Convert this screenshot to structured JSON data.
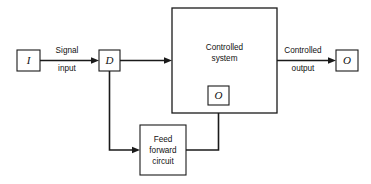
{
  "diagram": {
    "type": "block-diagram",
    "background_color": "#ffffff",
    "line_color": "#1a1a1a",
    "nodes": {
      "input": {
        "label": "I",
        "name": "input-block",
        "shape": "rect",
        "x": 17,
        "y": 50,
        "w": 23,
        "h": 21
      },
      "detector": {
        "label": "D",
        "name": "detector-block",
        "shape": "rect",
        "x": 99,
        "y": 50,
        "w": 21,
        "h": 21
      },
      "controlled_system": {
        "label_line1": "Controlled",
        "label_line2": "system",
        "name": "controlled-system-block",
        "shape": "rect",
        "x": 172,
        "y": 8,
        "w": 105,
        "h": 105
      },
      "inner_output": {
        "label": "O",
        "name": "inner-output-block",
        "shape": "rect",
        "x": 208,
        "y": 86,
        "w": 21,
        "h": 19
      },
      "feed_forward": {
        "label_line1": "Feed",
        "label_line2": "forward",
        "label_line3": "circuit",
        "name": "feed-forward-block",
        "shape": "rect",
        "x": 140,
        "y": 125,
        "w": 46,
        "h": 50
      },
      "output": {
        "label": "O",
        "name": "output-block",
        "shape": "rect",
        "x": 336,
        "y": 50,
        "w": 22,
        "h": 21
      }
    },
    "edge_labels": {
      "signal_input_line1": "Signal",
      "signal_input_line2": "input",
      "controlled_output_line1": "Controlled",
      "controlled_output_line2": "output"
    },
    "edges": [
      {
        "name": "edge-input-to-detector",
        "from": "input",
        "to": "detector",
        "label": "Signal input",
        "arrow": true
      },
      {
        "name": "edge-detector-to-system",
        "from": "detector",
        "to": "controlled_system",
        "label": "",
        "arrow": true
      },
      {
        "name": "edge-detector-to-feedforward",
        "from": "detector",
        "to": "feed_forward",
        "label": "",
        "arrow": true
      },
      {
        "name": "edge-feedforward-to-inner-output",
        "from": "feed_forward",
        "to": "inner_output",
        "label": "",
        "arrow": true
      },
      {
        "name": "edge-system-to-output",
        "from": "controlled_system",
        "to": "output",
        "label": "Controlled output",
        "arrow": true
      },
      {
        "name": "edge-inner-input-stub",
        "from": "",
        "to": "inner_output",
        "label": "",
        "arrow": true
      },
      {
        "name": "edge-inner-output-stub",
        "from": "inner_output",
        "to": "",
        "label": "",
        "arrow": true
      }
    ]
  }
}
